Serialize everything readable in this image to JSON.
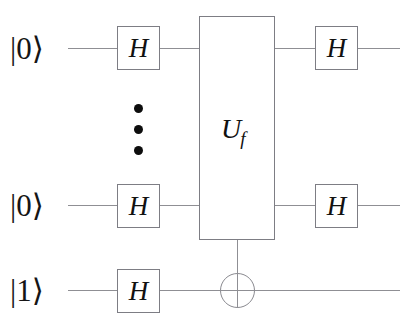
{
  "figure": {
    "type": "quantum-circuit",
    "title": "",
    "background_color": "#ffffff",
    "wire_color": "#8f8f94",
    "box_border_color": "#7d7d84",
    "text_color": "#111111"
  },
  "qubits": [
    {
      "id": "q0",
      "label": "|0⟩",
      "row": 1
    },
    {
      "id": "q1",
      "label": "|0⟩",
      "row": 2
    },
    {
      "id": "q2",
      "label": "|1⟩",
      "row": 3
    }
  ],
  "gates": {
    "hadamard_label": "H",
    "left_column": [
      {
        "qubit": "q0",
        "label": "H"
      },
      {
        "qubit": "q1",
        "label": "H"
      },
      {
        "qubit": "q2",
        "label": "H"
      }
    ],
    "right_column": [
      {
        "qubit": "q0",
        "label": "H"
      },
      {
        "qubit": "q1",
        "label": "H"
      }
    ],
    "oracle": {
      "symbol": "U",
      "subscript": "f",
      "label": "U_f",
      "spans_qubits": [
        "q0",
        "q1"
      ],
      "control_target_qubit": "q2"
    },
    "target": {
      "name": "cnot-target",
      "symbol": "⊕",
      "qubit": "q2"
    }
  },
  "ellipsis": {
    "name": "vertical-ellipsis",
    "meaning": "additional qubit wires omitted",
    "dot_count": 3
  }
}
